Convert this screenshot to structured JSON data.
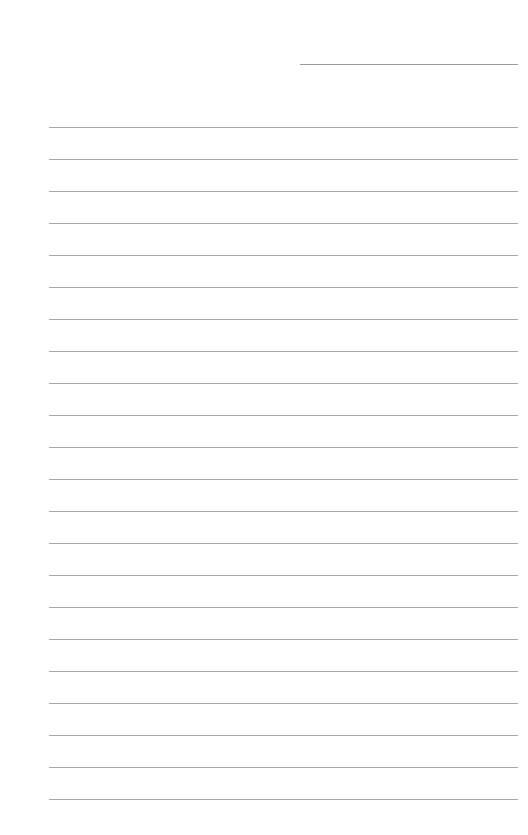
{
  "page": {
    "type": "lined-paper",
    "background": "#ffffff",
    "line_color": "#a8a8a8",
    "header_line": {
      "x": 300,
      "y": 64,
      "width": 218
    },
    "rules": {
      "x": 49,
      "width": 469,
      "first_y": 127,
      "spacing": 32,
      "count": 22
    }
  }
}
